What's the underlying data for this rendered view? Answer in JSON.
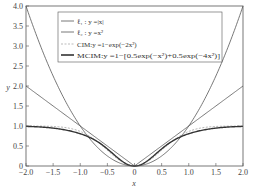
{
  "chart_data": {
    "type": "line",
    "title": "",
    "xlabel": "x",
    "ylabel": "y",
    "xlim": [
      -2.0,
      2.0
    ],
    "ylim": [
      0,
      4.0
    ],
    "grid": false,
    "legend_position": "upper center",
    "x_ticks": [
      "-2.0",
      "-1.5",
      "-1.0",
      "-0.5",
      "0",
      "0.5",
      "1.0",
      "1.5",
      "2.0"
    ],
    "y_ticks": [
      "0",
      "0.5",
      "1.0",
      "1.5",
      "2.0",
      "2.5",
      "3.0",
      "3.5",
      "4.0"
    ],
    "series": [
      {
        "name": "ℓ1 : y=|x|",
        "style": "solid thin",
        "color": "#555555",
        "formula": "abs(x)",
        "x": [
          -2.0,
          -1.5,
          -1.0,
          -0.5,
          0,
          0.5,
          1.0,
          1.5,
          2.0
        ],
        "values": [
          2.0,
          1.5,
          1.0,
          0.5,
          0,
          0.5,
          1.0,
          1.5,
          2.0
        ]
      },
      {
        "name": "ℓ2 : y=x²",
        "style": "solid thin",
        "color": "#555555",
        "formula": "x^2",
        "x": [
          -2.0,
          -1.5,
          -1.0,
          -0.5,
          0,
          0.5,
          1.0,
          1.5,
          2.0
        ],
        "values": [
          4.0,
          2.25,
          1.0,
          0.25,
          0,
          0.25,
          1.0,
          2.25,
          4.0
        ]
      },
      {
        "name": "CIM: y=1−exp(−2x²)",
        "style": "dashed",
        "color": "#aaaaaa",
        "formula": "1-exp(-2x^2)",
        "x": [
          -2.0,
          -1.5,
          -1.0,
          -0.5,
          0,
          0.5,
          1.0,
          1.5,
          2.0
        ],
        "values": [
          1.0,
          0.989,
          0.865,
          0.393,
          0,
          0.393,
          0.865,
          0.989,
          1.0
        ]
      },
      {
        "name": "MCIM: y=1−[0.5exp(−x²)+0.5exp(−4x²)]",
        "style": "solid thick",
        "color": "#333333",
        "formula": "1-(0.5exp(-x^2)+0.5exp(-4x^2))",
        "x": [
          -2.0,
          -1.5,
          -1.0,
          -0.5,
          0,
          0.5,
          1.0,
          1.5,
          2.0
        ],
        "values": [
          0.991,
          0.947,
          0.807,
          0.427,
          0,
          0.427,
          0.807,
          0.947,
          0.991
        ]
      }
    ]
  },
  "legend": {
    "l1": "ℓ₁ : y =|x|",
    "l2": "ℓ₂ : y =x²",
    "cim": "CIM:y =1−exp(−2x²)",
    "mcim": "MCIM:y =1−[0.5exp(−x²)+0.5exp(−4x²)]"
  }
}
